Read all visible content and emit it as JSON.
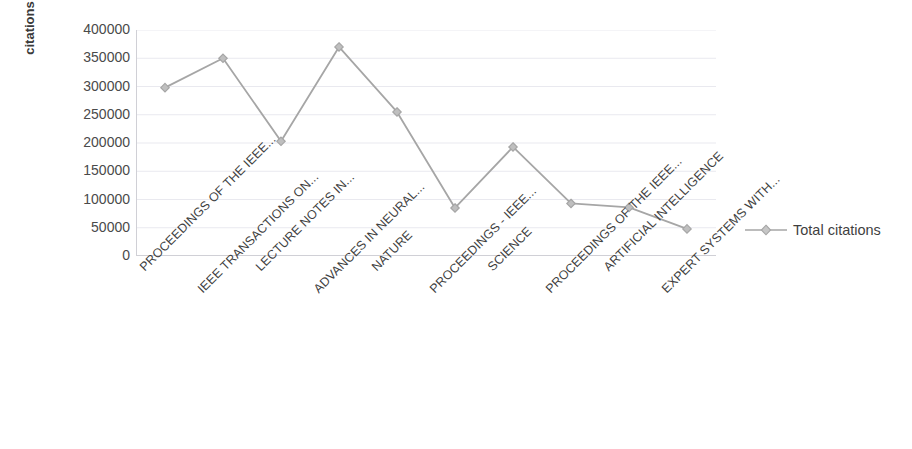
{
  "chart_data": {
    "type": "line",
    "title": "",
    "xlabel": "",
    "ylabel": "citations",
    "ylim": [
      0,
      400000
    ],
    "ytick_labels": [
      "400000",
      "350000",
      "300000",
      "250000",
      "200000",
      "150000",
      "100000",
      "50000",
      "0"
    ],
    "ytick_values": [
      400000,
      350000,
      300000,
      250000,
      200000,
      150000,
      100000,
      50000,
      0
    ],
    "grid": true,
    "legend_position": "right",
    "legend": [
      "Total citations"
    ],
    "marker": "diamond",
    "line_color": "#a6a6a6",
    "marker_color": "#bfbfbf",
    "categories": [
      "PROCEEDINGS OF THE IEEE...",
      "IEEE TRANSACTIONS ON...",
      "LECTURE NOTES IN...",
      "ADVANCES IN NEURAL...",
      "NATURE",
      "PROCEEDINGS - IEEE...",
      "SCIENCE",
      "PROCEEDINGS OF THE IEEE...",
      "ARTIFICIAL INTELLIGENCE",
      "EXPERT SYSTEMS WITH..."
    ],
    "series": [
      {
        "name": "Total citations",
        "values": [
          298000,
          350000,
          203000,
          370000,
          255000,
          85000,
          193000,
          93000,
          86000,
          48000
        ]
      }
    ]
  },
  "axis": {
    "y_title": "citations"
  },
  "legend": {
    "entries": [
      {
        "label": "Total citations",
        "marker": "diamond-marker-icon",
        "color": "#a6a6a6"
      }
    ]
  },
  "colors": {
    "line": "#a6a6a6",
    "marker": "#c0c0c0",
    "grid": "#e9e9ef",
    "axis": "#d0d0d6",
    "text": "#404040"
  }
}
